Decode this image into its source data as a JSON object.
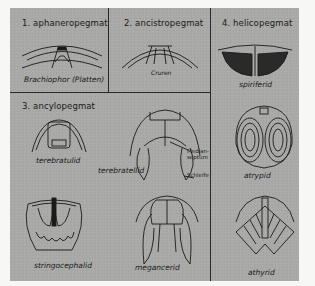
{
  "figure": {
    "background_color": "#a9a9a7",
    "line_color": "#1a1a1a",
    "cells": [
      {
        "id": "aphaneropegmat",
        "title": "1. aphaneropegmat",
        "specimens": [
          {
            "name": "Brachiophor (Platten)",
            "annotations": []
          }
        ]
      },
      {
        "id": "ancistropegmat",
        "title": "2. ancistropegmat",
        "specimens": [
          {
            "name": "Cruren",
            "annotations": []
          }
        ]
      },
      {
        "id": "ancylopegmat",
        "title": "3. ancylopegmat",
        "specimens": [
          {
            "name": "terebratulid",
            "annotations": []
          },
          {
            "name": "terebratellid",
            "annotations": [
              "Median-",
              "septum",
              "Schleife"
            ]
          },
          {
            "name": "stringocephalid",
            "annotations": []
          },
          {
            "name": "megancerid",
            "annotations": []
          }
        ]
      },
      {
        "id": "helicopegmat",
        "title": "4. helicopegmat",
        "specimens": [
          {
            "name": "spiriferid",
            "annotations": []
          },
          {
            "name": "atrypid",
            "annotations": []
          },
          {
            "name": "athyrid",
            "annotations": []
          }
        ]
      }
    ]
  }
}
